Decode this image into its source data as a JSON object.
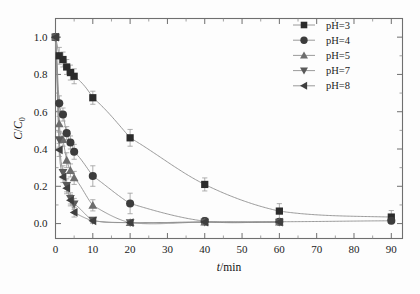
{
  "chart_data": {
    "type": "scatter",
    "title": "",
    "subtitle": "",
    "xlabel": "t/min",
    "xlabel_italic_part": "t",
    "xlabel_rest": "/min",
    "ylabel": "C/C0",
    "ylabel_numerator": "C",
    "ylabel_denominator_sub": "0",
    "xlim": [
      0,
      93
    ],
    "ylim": [
      -0.08,
      1.1
    ],
    "xticks": [
      0,
      10,
      20,
      30,
      40,
      50,
      60,
      70,
      80,
      90
    ],
    "xtick_labels": [
      "0",
      "10",
      "20",
      "30",
      "40",
      "50",
      "60",
      "70",
      "80",
      "90"
    ],
    "yticks": [
      0.0,
      0.2,
      0.4,
      0.6,
      0.8,
      1.0
    ],
    "ytick_labels": [
      "0.0",
      "0.2",
      "0.4",
      "0.6",
      "0.8",
      "1.0"
    ],
    "grid": false,
    "minor_ticks": true,
    "legend_position": "top-right-inside",
    "error_bars": "symmetric-y",
    "series": [
      {
        "name": "pH=3",
        "marker": "square",
        "color": "#2b2b2b",
        "x": [
          0,
          1,
          2,
          3,
          4,
          5,
          10,
          20,
          40,
          60,
          90
        ],
        "values": [
          1.0,
          0.9,
          0.88,
          0.84,
          0.81,
          0.79,
          0.675,
          0.46,
          0.21,
          0.067,
          0.035
        ],
        "yerr": [
          0.0,
          0.045,
          0.04,
          0.04,
          0.04,
          0.04,
          0.035,
          0.045,
          0.035,
          0.04,
          0.035
        ]
      },
      {
        "name": "pH=4",
        "marker": "circle",
        "color": "#3c3c3c",
        "x": [
          0,
          1,
          2,
          3,
          4,
          5,
          10,
          20,
          40,
          60,
          90
        ],
        "values": [
          1.0,
          0.645,
          0.585,
          0.485,
          0.435,
          0.385,
          0.255,
          0.108,
          0.013,
          0.01,
          0.015
        ],
        "yerr": [
          0.0,
          0.04,
          0.035,
          0.035,
          0.035,
          0.04,
          0.055,
          0.055,
          0.02,
          0.015,
          0.015
        ]
      },
      {
        "name": "pH=5",
        "marker": "triangle-up",
        "color": "#6d6d6d",
        "x": [
          0,
          1,
          2,
          3,
          4,
          5,
          10,
          20,
          40,
          60
        ],
        "values": [
          1.0,
          0.535,
          0.45,
          0.34,
          0.285,
          0.245,
          0.098,
          0.005,
          0.008,
          0.008
        ],
        "yerr": [
          0.0,
          0.04,
          0.035,
          0.04,
          0.035,
          0.035,
          0.03,
          0.012,
          0.012,
          0.01
        ]
      },
      {
        "name": "pH=7",
        "marker": "triangle-down",
        "color": "#5a5a5a",
        "x": [
          0,
          1,
          2,
          3,
          4,
          5,
          10,
          20,
          40,
          60
        ],
        "values": [
          1.0,
          0.45,
          0.275,
          0.205,
          0.135,
          0.105,
          0.018,
          0.005,
          0.008,
          0.008
        ],
        "yerr": [
          0.0,
          0.04,
          0.035,
          0.035,
          0.03,
          0.03,
          0.015,
          0.01,
          0.01,
          0.01
        ]
      },
      {
        "name": "pH=8",
        "marker": "triangle-left",
        "color": "#3f3f3f",
        "x": [
          0,
          1,
          2,
          3,
          4,
          5,
          10,
          20,
          40,
          60
        ],
        "values": [
          1.0,
          0.395,
          0.25,
          0.19,
          0.125,
          0.06,
          0.015,
          0.005,
          0.008,
          0.008
        ],
        "yerr": [
          0.0,
          0.035,
          0.03,
          0.03,
          0.03,
          0.025,
          0.012,
          0.01,
          0.01,
          0.01
        ]
      }
    ],
    "legend_entries": [
      {
        "label": "pH=3",
        "marker": "square",
        "color": "#2b2b2b"
      },
      {
        "label": "pH=4",
        "marker": "circle",
        "color": "#3c3c3c"
      },
      {
        "label": "pH=5",
        "marker": "triangle-up",
        "color": "#6d6d6d"
      },
      {
        "label": "pH=7",
        "marker": "triangle-down",
        "color": "#5a5a5a"
      },
      {
        "label": "pH=8",
        "marker": "triangle-left",
        "color": "#3f3f3f"
      }
    ]
  },
  "colors": {
    "frame": "#6f6f6f",
    "fitline": "#8e8e8e",
    "errorbar": "#9a9a9a",
    "text": "#1c1c1c",
    "background": "#fdfdfd"
  }
}
